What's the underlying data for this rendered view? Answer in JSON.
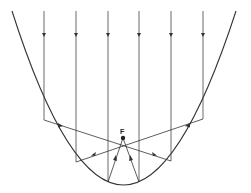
{
  "diagram": {
    "focus_label": "F",
    "colors": {
      "line": "#333333",
      "background": "#ffffff"
    },
    "focus": {
      "x": 123,
      "y": 138
    },
    "parabola": {
      "left_top": [
        12,
        11
      ],
      "vertex": [
        123,
        185
      ],
      "right_top": [
        236,
        11
      ]
    },
    "rays": [
      {
        "x": 44,
        "reflect_point": [
          44,
          120
        ]
      },
      {
        "x": 76,
        "reflect_point": [
          76,
          162
        ]
      },
      {
        "x": 108,
        "reflect_point": [
          108,
          182
        ]
      },
      {
        "x": 139,
        "reflect_point": [
          139,
          182
        ]
      },
      {
        "x": 171,
        "reflect_point": [
          171,
          161
        ]
      },
      {
        "x": 203,
        "reflect_point": [
          203,
          119
        ]
      }
    ]
  }
}
